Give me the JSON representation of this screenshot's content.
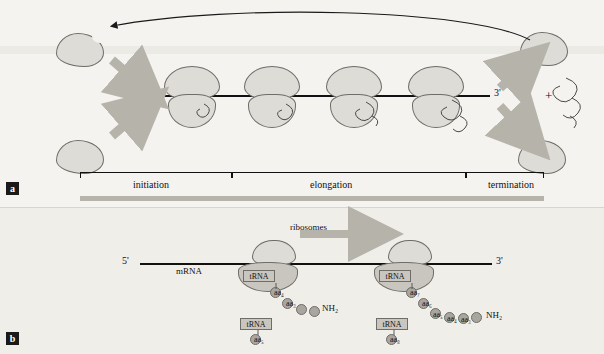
{
  "figure": {
    "panel_a": {
      "label": "a",
      "five_prime": "5'",
      "three_prime": "3'",
      "stage_labels": [
        "initiation",
        "elongation",
        "termination"
      ],
      "plus_sign": "+",
      "ribosome_count_on_mrna": 4
    },
    "panel_b": {
      "label": "b",
      "five_prime": "5'",
      "three_prime": "3'",
      "mrna_label": "mRNA",
      "ribosomes_label": "ribosomes",
      "complex_left": {
        "trna_bound": "tRNA",
        "trna_free": "tRNA",
        "aa_bound": "aa₄",
        "aa_free": "aa₅",
        "chain": [
          "aa₃",
          "aa₂",
          "aa₁"
        ],
        "terminus": "NH₂"
      },
      "complex_right": {
        "trna_bound": "tRNA",
        "trna_free": "tRNA",
        "aa_bound": "aa₇",
        "aa_free": "aa₈",
        "chain": [
          "aa₆",
          "aa₅",
          "aa₄",
          "aa₃",
          "aa₂",
          "aa₁"
        ],
        "terminus": "NH₂"
      }
    },
    "colors": {
      "background_a": "#f5f3ef",
      "background_b": "#f0eee9",
      "ribosome_fill": "#dedcd6",
      "ribosome_stroke": "#6f6d67",
      "arrow_grey": "#b6b3ab",
      "aa_fill": "#a9a6a0",
      "trna_fill": "#c9c6c0",
      "line_black": "#111111"
    }
  }
}
